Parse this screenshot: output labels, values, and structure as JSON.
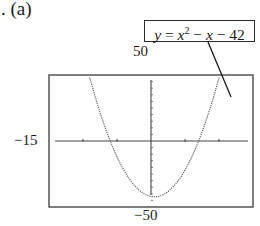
{
  "part_label": ". (a)",
  "equation": {
    "lhs": "y",
    "eq": "=",
    "base": "x",
    "exp": "2",
    "rest_op1": "−",
    "rest_var": "x",
    "rest_op2": "−",
    "rest_const": "42"
  },
  "window": {
    "ymax_label": "50",
    "ymin_label": "−50",
    "xmin_label": "−15"
  },
  "chart_data": {
    "type": "line",
    "function": "x^2 - x - 42",
    "xlabel": "",
    "ylabel": "",
    "xlim": [
      -15,
      15
    ],
    "ylim": [
      -50,
      50
    ],
    "x_tick_step": 5,
    "y_tick_step": 5,
    "grid": false,
    "legend": "none",
    "annotations": [
      {
        "text": "y = x² − x − 42",
        "type": "callout-box",
        "points_to": "right branch of curve"
      }
    ],
    "x_intercepts": [
      -6,
      7
    ],
    "vertex": [
      0.5,
      -42.25
    ],
    "series": [
      {
        "name": "y = x^2 - x - 42",
        "x": [
          -3,
          -2,
          -1,
          0,
          0.5,
          1,
          2,
          3,
          4,
          5,
          6,
          7,
          8,
          9,
          10
        ],
        "y": [
          -30,
          -36,
          -40,
          -42,
          -42.25,
          -42,
          -40,
          -36,
          -30,
          -22,
          -12,
          0,
          14,
          30,
          48
        ]
      }
    ]
  }
}
